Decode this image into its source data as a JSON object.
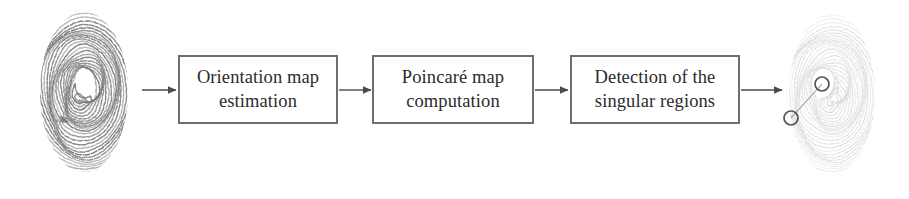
{
  "figure": {
    "type": "block-diagram",
    "background_color": "#ffffff",
    "orientation": "left-to-right"
  },
  "palette": {
    "box_border": "#6e6e70",
    "box_fill": "#ffffff",
    "text": "#2b2b2d",
    "arrow": "#4a4a4c",
    "ridge_dark": "#6f6f72",
    "ridge_light": "#c9c9cf",
    "marker_circle": "#55555a",
    "marker_link": "#9a9aa0"
  },
  "stages": [
    {
      "id": "orientation-map-estimation",
      "label": "Orientation map\nestimation",
      "line1": "Orientation map",
      "line2": "estimation",
      "order": 1
    },
    {
      "id": "poincare-map-computation",
      "label": "Poincaré map\ncomputation",
      "line1": "Poincaré map",
      "line2": "computation",
      "order": 2
    },
    {
      "id": "detection-of-singular-regions",
      "label": "Detection of the\nsingular regions",
      "line1": "Detection of the",
      "line2": "singular regions",
      "order": 3
    }
  ],
  "images": {
    "input": {
      "id": "input-fingerprint",
      "alt": "input fingerprint image",
      "role": "pipeline input",
      "tone": "dark",
      "pattern": "loop"
    },
    "output": {
      "id": "output-fingerprint",
      "alt": "output fingerprint with detected singular regions marked",
      "role": "pipeline output",
      "tone": "light",
      "pattern": "loop",
      "markers": [
        {
          "id": "core-marker",
          "name": "core",
          "cx": 40,
          "cy": 76,
          "r": 7
        },
        {
          "id": "delta-marker",
          "name": "delta",
          "cx": 9,
          "cy": 110,
          "r": 7
        }
      ],
      "marker_link": {
        "from": "core-marker",
        "to": "delta-marker"
      }
    }
  },
  "arrows": [
    {
      "id": "arrow-input-to-stage1",
      "from": "input-fingerprint",
      "to": "orientation-map-estimation",
      "x1": 142,
      "x2": 176,
      "y": 90
    },
    {
      "id": "arrow-stage1-to-stage2",
      "from": "orientation-map-estimation",
      "to": "poincare-map-computation",
      "x1": 339,
      "x2": 371,
      "y": 90
    },
    {
      "id": "arrow-stage2-to-stage3",
      "from": "poincare-map-computation",
      "to": "detection-of-singular-regions",
      "x1": 535,
      "x2": 568,
      "y": 90
    },
    {
      "id": "arrow-stage3-to-output",
      "from": "detection-of-singular-regions",
      "to": "output-fingerprint",
      "x1": 741,
      "x2": 782,
      "y": 90
    }
  ]
}
